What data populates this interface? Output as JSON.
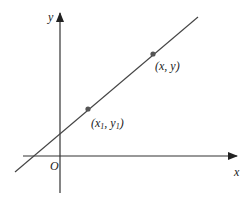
{
  "diagram": {
    "axes": {
      "x_label": "x",
      "y_label": "y",
      "origin_label": "O"
    },
    "line": {
      "start": [
        15,
        172
      ],
      "end": [
        198,
        17
      ]
    },
    "points": [
      {
        "name": "point-x1-y1",
        "pos": [
          88,
          109
        ],
        "label_pre": "(x",
        "sub1": "1",
        "label_mid": ", y",
        "sub2": "1",
        "label_post": ")"
      },
      {
        "name": "point-x-y",
        "pos": [
          153,
          54
        ],
        "label": "(x, y)"
      }
    ],
    "colors": {
      "line": "#333333",
      "point": "#555555"
    }
  }
}
